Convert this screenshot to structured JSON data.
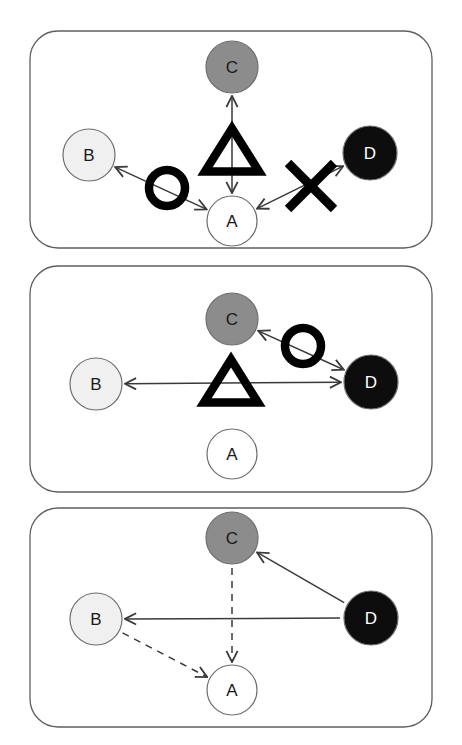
{
  "figure": {
    "width": 462,
    "height": 745,
    "background": "#ffffff"
  },
  "colors": {
    "node_a_fill": "#ffffff",
    "node_b_fill": "#f0f0f0",
    "node_c_fill": "#8c8c8c",
    "node_d_fill": "#0d0d0d",
    "node_stroke": "#6e6e6e",
    "panel_border": "#5f5f5f",
    "edge": "#3a3a3a",
    "symbol": "#000000",
    "label_dark": "#1a1a1a",
    "label_light": "#ffffff"
  },
  "node_styles": {
    "A": {
      "fill": "#ffffff",
      "label_color": "#1a1a1a",
      "shade": "white"
    },
    "B": {
      "fill": "#f0f0f0",
      "label_color": "#1a1a1a",
      "shade": "light-gray"
    },
    "C": {
      "fill": "#8c8c8c",
      "label_color": "#1a1a1a",
      "shade": "medium-gray"
    },
    "D": {
      "fill": "#0d0d0d",
      "label_color": "#ffffff",
      "shade": "black"
    }
  },
  "panels": [
    {
      "id": "panel-1",
      "index": 1,
      "frame": {
        "x": 30,
        "y": 31,
        "width": 402,
        "height": 217,
        "radius": 28
      },
      "nodes": [
        {
          "id": "A",
          "label": "A",
          "cx": 232,
          "cy": 221,
          "r": 25
        },
        {
          "id": "B",
          "label": "B",
          "cx": 89,
          "cy": 155,
          "r": 26
        },
        {
          "id": "C",
          "label": "C",
          "cx": 232,
          "cy": 67,
          "r": 26
        },
        {
          "id": "D",
          "label": "D",
          "cx": 370,
          "cy": 153,
          "r": 27
        }
      ],
      "edges": [
        {
          "id": "e1-ca",
          "from": "C",
          "to": "A",
          "style": "solid",
          "arrows": "both"
        },
        {
          "id": "e1-ba",
          "from": "B",
          "to": "A",
          "style": "solid",
          "arrows": "both"
        },
        {
          "id": "e1-ad",
          "from": "A",
          "to": "D",
          "style": "solid",
          "arrows": "both"
        }
      ],
      "symbols": [
        {
          "id": "s1-triangle",
          "glyph": "triangle",
          "cx": 232,
          "cy": 150,
          "size": 54,
          "on_edge": "e1-ca"
        },
        {
          "id": "s1-ring",
          "glyph": "ring",
          "cx": 167,
          "cy": 188,
          "size": 44,
          "on_edge": "e1-ba"
        },
        {
          "id": "s1-cross",
          "glyph": "cross",
          "cx": 311,
          "cy": 186,
          "size": 46,
          "on_edge": "e1-ad"
        }
      ]
    },
    {
      "id": "panel-2",
      "index": 2,
      "frame": {
        "x": 30,
        "y": 266,
        "width": 402,
        "height": 226,
        "radius": 28
      },
      "nodes": [
        {
          "id": "A",
          "label": "A",
          "cx": 232,
          "cy": 454,
          "r": 25
        },
        {
          "id": "B",
          "label": "B",
          "cx": 96,
          "cy": 384,
          "r": 26
        },
        {
          "id": "C",
          "label": "C",
          "cx": 232,
          "cy": 319,
          "r": 26
        },
        {
          "id": "D",
          "label": "D",
          "cx": 371,
          "cy": 382,
          "r": 27
        }
      ],
      "edges": [
        {
          "id": "e2-cd",
          "from": "C",
          "to": "D",
          "style": "solid",
          "arrows": "both"
        },
        {
          "id": "e2-bd",
          "from": "B",
          "to": "D",
          "style": "solid",
          "arrows": "both"
        }
      ],
      "symbols": [
        {
          "id": "s2-ring",
          "glyph": "ring",
          "cx": 303,
          "cy": 346,
          "size": 44,
          "on_edge": "e2-cd"
        },
        {
          "id": "s2-triangle",
          "glyph": "triangle",
          "cx": 231,
          "cy": 381,
          "size": 54,
          "on_edge": "e2-bd"
        }
      ]
    },
    {
      "id": "panel-3",
      "index": 3,
      "frame": {
        "x": 30,
        "y": 508,
        "width": 402,
        "height": 219,
        "radius": 28
      },
      "nodes": [
        {
          "id": "A",
          "label": "A",
          "cx": 232,
          "cy": 690,
          "r": 25
        },
        {
          "id": "B",
          "label": "B",
          "cx": 96,
          "cy": 619,
          "r": 26
        },
        {
          "id": "C",
          "label": "C",
          "cx": 232,
          "cy": 538,
          "r": 26
        },
        {
          "id": "D",
          "label": "D",
          "cx": 371,
          "cy": 618,
          "r": 27
        }
      ],
      "edges": [
        {
          "id": "e3-dc",
          "from": "D",
          "to": "C",
          "style": "solid",
          "arrows": "to"
        },
        {
          "id": "e3-db",
          "from": "D",
          "to": "B",
          "style": "solid",
          "arrows": "to"
        },
        {
          "id": "e3-ca",
          "from": "C",
          "to": "A",
          "style": "dashed",
          "arrows": "to"
        },
        {
          "id": "e3-ba",
          "from": "B",
          "to": "A",
          "style": "dashed",
          "arrows": "to"
        }
      ],
      "symbols": []
    }
  ],
  "legend": {
    "symbol_names": [
      "triangle",
      "ring",
      "cross"
    ],
    "edge_styles": [
      "solid",
      "dashed"
    ],
    "arrow_modes": [
      "both",
      "to"
    ]
  }
}
